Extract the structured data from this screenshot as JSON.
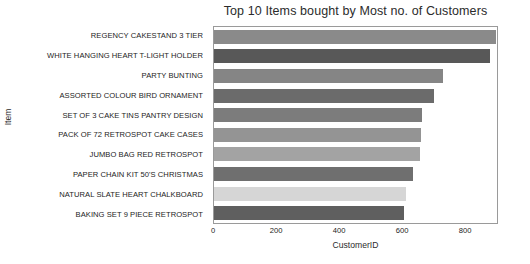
{
  "chart_data": {
    "type": "bar",
    "orientation": "horizontal",
    "title": "Top 10 Items bought by Most no. of Customers",
    "xlabel": "CustomerID",
    "ylabel": "Item",
    "categories": [
      "REGENCY CAKESTAND 3 TIER",
      "WHITE HANGING HEART T-LIGHT HOLDER",
      "PARTY BUNTING",
      "ASSORTED COLOUR BIRD ORNAMENT",
      "SET OF 3 CAKE TINS PANTRY DESIGN",
      "PACK OF 72 RETROSPOT CAKE CASES",
      "JUMBO BAG RED RETROSPOT",
      "PAPER CHAIN KIT 50'S CHRISTMAS",
      "NATURAL SLATE HEART CHALKBOARD",
      "BAKING SET 9 PIECE RETROSPOT"
    ],
    "values": [
      894,
      875,
      727,
      699,
      661,
      658,
      655,
      633,
      608,
      602
    ],
    "bar_colors": [
      "#8a8a8a",
      "#585858",
      "#858585",
      "#6b6b6b",
      "#7c7c7c",
      "#949494",
      "#a3a3a3",
      "#6f6f6f",
      "#d6d6d6",
      "#5f5f5f"
    ],
    "xticks": [
      0,
      200,
      400,
      600,
      800
    ],
    "xlim": [
      0,
      898
    ],
    "ylim": [
      0,
      10
    ],
    "grid": false,
    "legend": null
  }
}
